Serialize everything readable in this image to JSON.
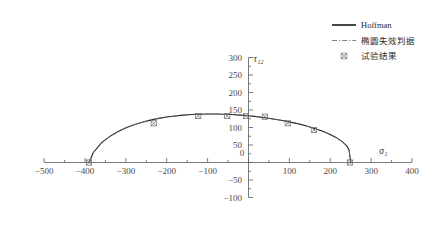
{
  "chart_data": {
    "type": "line",
    "title": "",
    "subtitle": "",
    "xlabel": "σ",
    "xlabel_sub": "1",
    "ylabel": "τ",
    "ylabel_sub": "12",
    "xlim": [
      -500,
      400
    ],
    "ylim": [
      -100,
      300
    ],
    "xticks": [
      -500,
      -400,
      -300,
      -200,
      -100,
      0,
      100,
      200,
      300,
      400
    ],
    "xtick_labels": [
      "−500",
      "−400",
      "−300",
      "−200",
      "−100",
      "0",
      "100",
      "200",
      "300",
      "400"
    ],
    "yticks": [
      -100,
      -50,
      0,
      50,
      100,
      150,
      200,
      250,
      300
    ],
    "ytick_labels": [
      "−100",
      "−50",
      "0",
      "50",
      "100",
      "150",
      "200",
      "250",
      "300"
    ],
    "xminor_step": 50,
    "yminor_step": 25,
    "grid": false,
    "axes_style": "cartesian-crossed-at-origin",
    "legend_position": "upper-right",
    "legend": [
      {
        "label": "Hoffman",
        "style": "solid-line",
        "color": "#1a1a1a"
      },
      {
        "label": "椭圆失效判据",
        "style": "dash-dot-line",
        "color": "#707070"
      },
      {
        "label": "试验结果",
        "style": "crossed-square-marker",
        "color": "#6b6b6b"
      }
    ],
    "series": [
      {
        "name": "Hoffman",
        "style": "solid-line",
        "color": "#1a1a1a",
        "x": [
          -390,
          -380,
          -360,
          -340,
          -320,
          -300,
          -280,
          -260,
          -240,
          -220,
          -200,
          -180,
          -160,
          -140,
          -120,
          -100,
          -80,
          -60,
          -40,
          -20,
          0,
          20,
          40,
          60,
          80,
          100,
          120,
          140,
          160,
          180,
          200,
          215,
          230,
          240,
          246,
          250
        ],
        "y": [
          0,
          28,
          56,
          74,
          88,
          99,
          108,
          115,
          121,
          126,
          130,
          133,
          135.5,
          137,
          138,
          138.5,
          138.5,
          138,
          137,
          135.5,
          133.5,
          131,
          128,
          124.5,
          120.5,
          116,
          111,
          105,
          98,
          90,
          80,
          71,
          59,
          48,
          36,
          0
        ]
      },
      {
        "name": "椭圆失效判据",
        "style": "dash-dot-line",
        "color": "#707070",
        "x": [
          -390,
          -380,
          -360,
          -340,
          -320,
          -300,
          -280,
          -260,
          -240,
          -220,
          -200,
          -180,
          -160,
          -140,
          -120,
          -100,
          -80,
          -60,
          -40,
          -20,
          0,
          20,
          40,
          60,
          80,
          100,
          120,
          140,
          160,
          180,
          200,
          215,
          230,
          240,
          246,
          250
        ],
        "y": [
          0,
          28,
          56,
          74,
          88,
          99,
          108,
          115,
          121,
          126,
          130,
          133,
          135.5,
          137,
          138,
          138.5,
          138.5,
          138,
          137,
          135.5,
          133.5,
          131,
          128,
          124.5,
          120.5,
          116,
          111,
          105,
          98,
          90,
          80,
          71,
          59,
          48,
          36,
          0
        ]
      }
    ],
    "scatter": {
      "name": "试验结果",
      "marker": "crossed-square",
      "color": "#6b6b6b",
      "points": [
        {
          "x": -390,
          "y": 0
        },
        {
          "x": -232,
          "y": 112
        },
        {
          "x": -123,
          "y": 133
        },
        {
          "x": -52,
          "y": 133
        },
        {
          "x": -6,
          "y": 133
        },
        {
          "x": 40,
          "y": 131
        },
        {
          "x": 96,
          "y": 112
        },
        {
          "x": 160,
          "y": 93
        },
        {
          "x": 248,
          "y": 0
        }
      ]
    }
  }
}
